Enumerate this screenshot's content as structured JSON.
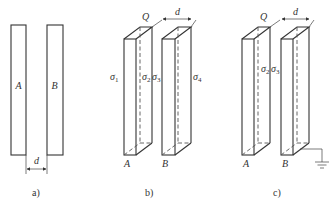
{
  "diagram": {
    "type": "physics-figure",
    "colors": {
      "line": "#333333",
      "background": "#ffffff"
    },
    "panels": [
      {
        "id": "a",
        "caption": "a)",
        "view": "side",
        "plates": [
          {
            "label": "A"
          },
          {
            "label": "B"
          }
        ],
        "dimension": {
          "label": "d"
        }
      },
      {
        "id": "b",
        "caption": "b)",
        "view": "3d",
        "plates": [
          {
            "label": "A"
          },
          {
            "label": "B"
          }
        ],
        "charge": {
          "label": "Q"
        },
        "dimension": {
          "label": "d"
        },
        "surface_charges": [
          {
            "symbol": "σ",
            "sub": "1"
          },
          {
            "symbol": "σ",
            "sub": "2"
          },
          {
            "symbol": "σ",
            "sub": "3"
          },
          {
            "symbol": "σ",
            "sub": "4"
          }
        ]
      },
      {
        "id": "c",
        "caption": "c)",
        "view": "3d",
        "plates": [
          {
            "label": "A"
          },
          {
            "label": "B"
          }
        ],
        "charge": {
          "label": "Q"
        },
        "dimension": {
          "label": "d"
        },
        "surface_charges": [
          {
            "symbol": "σ",
            "sub": "2"
          },
          {
            "symbol": "σ",
            "sub": "3"
          }
        ],
        "ground": {
          "attached_to": "B",
          "icon": "ground-icon"
        }
      }
    ]
  }
}
